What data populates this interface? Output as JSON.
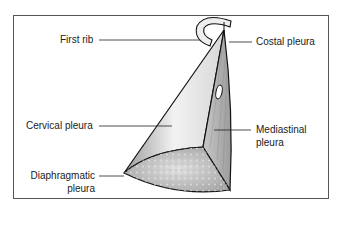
{
  "figure": {
    "labels": {
      "first_rib": "First rib",
      "costal_pleura": "Costal pleura",
      "cervical_pleura": "Cervical pleura",
      "mediastinal_pleura_1": "Mediastinal",
      "mediastinal_pleura_2": "pleura",
      "diaphragmatic_pleura_1": "Diaphragmatic",
      "diaphragmatic_pleura_2": "pleura"
    }
  }
}
